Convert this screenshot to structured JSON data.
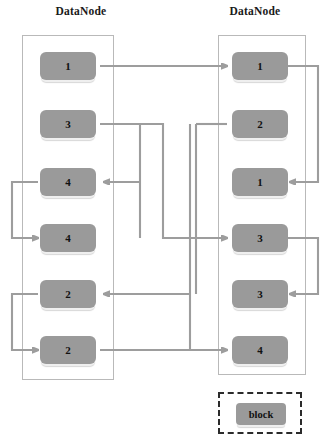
{
  "diagram": {
    "type": "block-replication-diagram",
    "left_node": {
      "title": "DataNode",
      "blocks": [
        {
          "label": "1"
        },
        {
          "label": "3"
        },
        {
          "label": "4"
        },
        {
          "label": "4"
        },
        {
          "label": "2"
        },
        {
          "label": "2"
        }
      ]
    },
    "right_node": {
      "title": "DataNode",
      "blocks": [
        {
          "label": "1"
        },
        {
          "label": "2"
        },
        {
          "label": "1"
        },
        {
          "label": "3"
        },
        {
          "label": "3"
        },
        {
          "label": "4"
        }
      ]
    },
    "legend": {
      "label": "block"
    },
    "colors": {
      "block_fill": "#9a9a9a",
      "wire": "#9d9d9d",
      "container_border": "#b9b9b9",
      "legend_border": "#2b2b2b",
      "text": "#111111",
      "background": "#ffffff"
    }
  }
}
